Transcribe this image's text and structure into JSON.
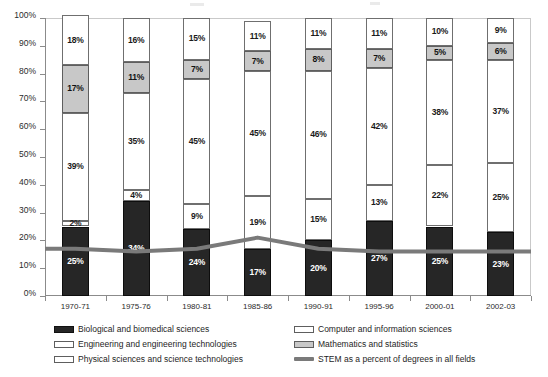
{
  "chart_data": {
    "type": "bar",
    "stacked": true,
    "title": "",
    "subtitle": "",
    "xlabel": "",
    "ylabel": "",
    "ylim": [
      0,
      100
    ],
    "y_tick_labels": [
      "0%",
      "10%",
      "20%",
      "30%",
      "40%",
      "50%",
      "60%",
      "70%",
      "80%",
      "90%",
      "100%"
    ],
    "y_ticks": [
      0,
      10,
      20,
      30,
      40,
      50,
      60,
      70,
      80,
      90,
      100
    ],
    "grid": false,
    "legend_position": "bottom",
    "categories": [
      "1970-71",
      "1975-76",
      "1980-81",
      "1985-86",
      "1990-91",
      "1995-96",
      "2000-01",
      "2002-03"
    ],
    "series": [
      {
        "name": "Biological and biomedical sciences",
        "key": "bio",
        "color": "#262626",
        "values": [
          25,
          34,
          24,
          17,
          20,
          27,
          25,
          23
        ],
        "labels": [
          "25%",
          "34%",
          "24%",
          "17%",
          "20%",
          "27%",
          "25%",
          "23%"
        ]
      },
      {
        "name": "Computer and information sciences",
        "key": "comp",
        "color": "#ffffff",
        "values": [
          2,
          4,
          9,
          19,
          15,
          13,
          22,
          25
        ],
        "labels": [
          "2%",
          "4%",
          "9%",
          "19%",
          "15%",
          "13%",
          "22%",
          "25%"
        ]
      },
      {
        "name": "Engineering and engineering technologies",
        "key": "eng",
        "color": "#ffffff",
        "values": [
          39,
          35,
          45,
          45,
          46,
          42,
          38,
          37
        ],
        "labels": [
          "39%",
          "35%",
          "45%",
          "45%",
          "46%",
          "42%",
          "38%",
          "37%"
        ]
      },
      {
        "name": "Mathematics and statistics",
        "key": "math",
        "color": "#c8c8c8",
        "values": [
          17,
          11,
          7,
          7,
          8,
          7,
          5,
          6
        ],
        "labels": [
          "17%",
          "11%",
          "7%",
          "7%",
          "8%",
          "7%",
          "5%",
          "6%"
        ]
      },
      {
        "name": "Physical sciences and science technologies",
        "key": "phys",
        "color": "#ffffff",
        "values": [
          18,
          16,
          15,
          11,
          11,
          11,
          10,
          9
        ],
        "labels": [
          "18%",
          "16%",
          "15%",
          "11%",
          "11%",
          "11%",
          "10%",
          "9%"
        ]
      }
    ],
    "line_series": {
      "name": "STEM as a percent of degrees in all fields",
      "key": "stem",
      "color": "#7a7a7a",
      "values": [
        17,
        16,
        17,
        21,
        17,
        16,
        16,
        16
      ],
      "labels": [
        "",
        "",
        "",
        "",
        "",
        "",
        "",
        ""
      ]
    }
  },
  "legend": {
    "left_items": [
      {
        "label": "Biological and biomedical sciences",
        "swatch": "bio"
      },
      {
        "label": "Engineering and engineering technologies",
        "swatch": "eng"
      },
      {
        "label": "Physical sciences and science technologies",
        "swatch": "phys"
      }
    ],
    "right_items": [
      {
        "label": "Computer and information sciences",
        "swatch": "comp"
      },
      {
        "label": "Mathematics and statistics",
        "swatch": "math"
      },
      {
        "label": "STEM as a percent of degrees in all fields",
        "swatch": "stem"
      }
    ]
  }
}
